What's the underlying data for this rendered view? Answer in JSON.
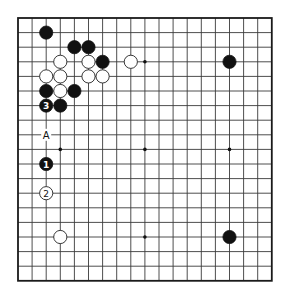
{
  "board": {
    "size": 19,
    "origin_x": 18,
    "origin_y": 18,
    "spacing_x": 14.1,
    "spacing_y": 14.6,
    "stone_radius": 6.6,
    "star_points": [
      [
        3,
        3
      ],
      [
        3,
        9
      ],
      [
        3,
        15
      ],
      [
        9,
        3
      ],
      [
        9,
        9
      ],
      [
        9,
        15
      ],
      [
        15,
        3
      ],
      [
        15,
        9
      ],
      [
        15,
        15
      ]
    ],
    "colors": {
      "black": "#111111",
      "white": "#ffffff",
      "line": "#3a3a3a"
    }
  },
  "stones": [
    {
      "color": "black",
      "col": 2,
      "row": 1
    },
    {
      "color": "black",
      "col": 4,
      "row": 2
    },
    {
      "color": "black",
      "col": 5,
      "row": 2
    },
    {
      "color": "white",
      "col": 3,
      "row": 3
    },
    {
      "color": "white",
      "col": 5,
      "row": 3
    },
    {
      "color": "black",
      "col": 6,
      "row": 3
    },
    {
      "color": "white",
      "col": 8,
      "row": 3
    },
    {
      "color": "black",
      "col": 15,
      "row": 3
    },
    {
      "color": "white",
      "col": 2,
      "row": 4
    },
    {
      "color": "white",
      "col": 3,
      "row": 4
    },
    {
      "color": "white",
      "col": 5,
      "row": 4
    },
    {
      "color": "white",
      "col": 6,
      "row": 4
    },
    {
      "color": "black",
      "col": 2,
      "row": 5
    },
    {
      "color": "white",
      "col": 3,
      "row": 5
    },
    {
      "color": "black",
      "col": 4,
      "row": 5
    },
    {
      "color": "black",
      "col": 2,
      "row": 6,
      "number": "3"
    },
    {
      "color": "black",
      "col": 3,
      "row": 6
    },
    {
      "color": "black",
      "col": 2,
      "row": 10,
      "number": "1"
    },
    {
      "color": "white",
      "col": 2,
      "row": 12,
      "number": "2"
    },
    {
      "color": "white",
      "col": 3,
      "row": 15
    },
    {
      "color": "black",
      "col": 15,
      "row": 15
    }
  ],
  "labels": [
    {
      "text": "A",
      "col": 2,
      "row": 8
    }
  ]
}
